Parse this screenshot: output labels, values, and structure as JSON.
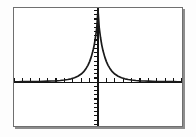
{
  "screen": {
    "device": "graphing-calculator-screen",
    "width": 196,
    "height": 137,
    "background_color": "#fdfdfd",
    "frame": {
      "border_color": "#6f6f6f",
      "shadow_color": "#8d8d8d",
      "fill_color": "#ffffff",
      "x": 13,
      "y": 7,
      "width": 170,
      "height": 120
    }
  },
  "axes": {
    "color": "#141414",
    "x_axis": {
      "label": "",
      "pixel_y": 58,
      "tick_count": 19,
      "tick_spacing_px": 8.4,
      "tick_length_px": 4,
      "tick_side": "above"
    },
    "y_axis": {
      "label": "",
      "pixel_x": 88,
      "tick_count": 24,
      "tick_spacing_px": 4.9,
      "tick_length_px": 4,
      "tick_side": "left"
    }
  },
  "chart_data": {
    "type": "line",
    "title": "",
    "subtitle": "",
    "xlabel": "",
    "ylabel": "",
    "grid": false,
    "legend": null,
    "legend_position": "none",
    "series_color": "#1a1a1a",
    "xlim": [
      -10,
      10
    ],
    "ylim": [
      -2.6,
      4.4
    ],
    "x_tick_step": 1,
    "y_tick_step": 0.25,
    "annotations": [],
    "series": [
      {
        "name": "y1",
        "x": [
          -10.0,
          -9.5,
          -9.0,
          -8.5,
          -8.0,
          -7.5,
          -7.0,
          -6.5,
          -6.0,
          -5.5,
          -5.0,
          -4.5,
          -4.0,
          -3.6,
          -3.2,
          -2.8,
          -2.4,
          -2.0,
          -1.7,
          -1.4,
          -1.2,
          -1.0,
          -0.8,
          -0.6,
          -0.45,
          -0.3,
          -0.15,
          0.0,
          0.15,
          0.3,
          0.45,
          0.6,
          0.8,
          1.0,
          1.2,
          1.4,
          1.7,
          2.0,
          2.4,
          2.8,
          3.2,
          3.6,
          4.0,
          4.5,
          5.0,
          5.5,
          6.0,
          6.5,
          7.0,
          7.5,
          8.0,
          8.5,
          9.0,
          9.5,
          10.0
        ],
        "y": [
          0.02,
          0.02,
          0.03,
          0.03,
          0.03,
          0.04,
          0.04,
          0.05,
          0.06,
          0.07,
          0.08,
          0.1,
          0.13,
          0.16,
          0.2,
          0.26,
          0.35,
          0.48,
          0.62,
          0.83,
          1.0,
          1.22,
          1.5,
          1.86,
          2.2,
          2.65,
          3.2,
          4.3,
          3.2,
          2.65,
          2.2,
          1.86,
          1.5,
          1.22,
          1.0,
          0.83,
          0.62,
          0.48,
          0.35,
          0.26,
          0.2,
          0.16,
          0.13,
          0.1,
          0.08,
          0.07,
          0.06,
          0.05,
          0.04,
          0.04,
          0.03,
          0.03,
          0.03,
          0.02,
          0.02
        ]
      }
    ]
  }
}
